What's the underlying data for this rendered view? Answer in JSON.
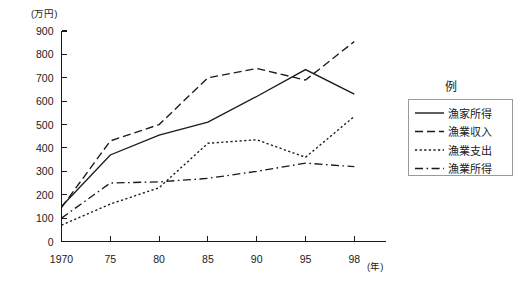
{
  "chart_data": {
    "type": "line",
    "title": "",
    "xlabel": "(年)",
    "ylabel": "(万円)",
    "x": [
      1970,
      1975,
      1980,
      1985,
      1990,
      1995,
      1998
    ],
    "xtick_labels": [
      "1970",
      "75",
      "80",
      "85",
      "90",
      "95",
      "98"
    ],
    "ytick_labels": [
      "0",
      "100",
      "200",
      "300",
      "400",
      "500",
      "600",
      "700",
      "800",
      "900"
    ],
    "ytick_values": [
      0,
      100,
      200,
      300,
      400,
      500,
      600,
      700,
      800,
      900
    ],
    "ylim": [
      0,
      900
    ],
    "grid": false,
    "legend_position": "right",
    "series": [
      {
        "name": "漁家所得",
        "style": "solid",
        "values": [
          150,
          370,
          455,
          510,
          620,
          735,
          630
        ]
      },
      {
        "name": "漁業収入",
        "style": "dashed",
        "values": [
          145,
          430,
          500,
          700,
          740,
          690,
          855
        ]
      },
      {
        "name": "漁業支出",
        "style": "dotted",
        "values": [
          70,
          160,
          230,
          420,
          435,
          360,
          535
        ]
      },
      {
        "name": "漁業所得",
        "style": "dashdot",
        "values": [
          100,
          250,
          255,
          270,
          300,
          335,
          320
        ]
      }
    ]
  },
  "legend": {
    "title": "例",
    "items": [
      {
        "label": "漁家所得",
        "style": "solid"
      },
      {
        "label": "漁業収入",
        "style": "dashed"
      },
      {
        "label": "漁業支出",
        "style": "dotted"
      },
      {
        "label": "漁業所得",
        "style": "dashdot"
      }
    ]
  },
  "axes": {
    "y_unit": "(万円)",
    "x_unit": "(年)"
  }
}
